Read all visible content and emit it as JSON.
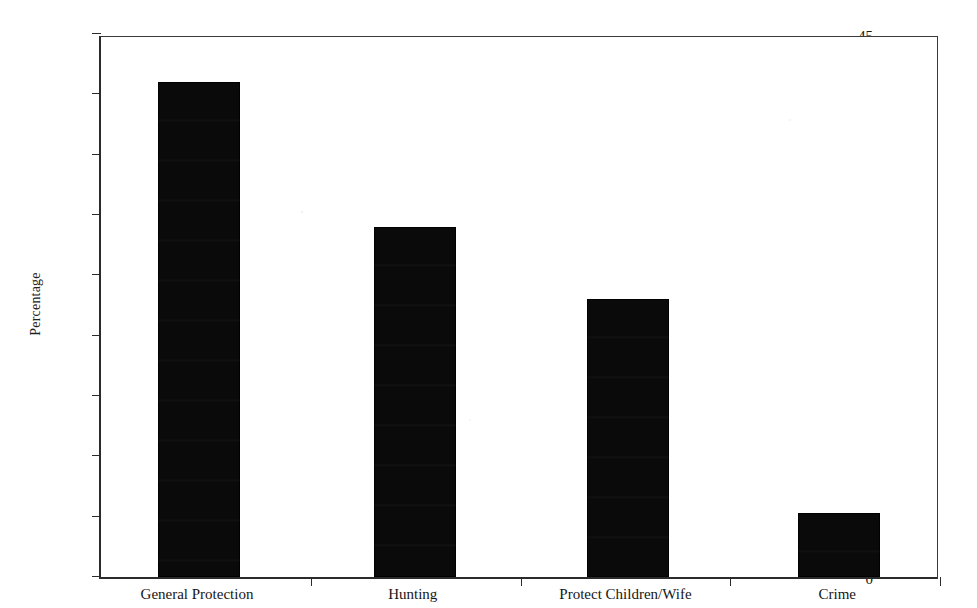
{
  "chart_data": {
    "type": "bar",
    "title": "",
    "xlabel": "",
    "ylabel": "Percentage",
    "categories": [
      "General Protection",
      "Hunting",
      "Protect Children/Wife",
      "Crime"
    ],
    "values": [
      41,
      29,
      23,
      5.3
    ],
    "ylim": [
      0,
      45
    ],
    "ytick_labels": [
      "0",
      "5",
      "10",
      "15",
      "20",
      "25",
      "30",
      "35",
      "40",
      "45"
    ],
    "ytick_values": [
      0,
      5,
      10,
      15,
      20,
      25,
      30,
      35,
      40,
      45
    ],
    "grid": false,
    "legend": false,
    "legend_position": "none",
    "bar_color": "#0a0a0a",
    "axis_color": "#2b2b2b",
    "background_color": "#ffffff"
  }
}
